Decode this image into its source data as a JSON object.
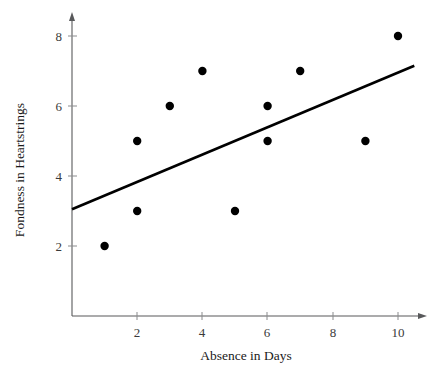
{
  "chart_data": {
    "type": "scatter",
    "title": "",
    "xlabel": "Absence in Days",
    "ylabel": "Fondness in Heartstrings",
    "xlim": [
      0,
      10.5
    ],
    "ylim": [
      0,
      8.6
    ],
    "grid": false,
    "legend": null,
    "x_ticks": [
      2,
      4,
      6,
      8,
      10
    ],
    "y_ticks": [
      2,
      4,
      6,
      8
    ],
    "x_tick_labels": [
      "2",
      "4",
      "6",
      "8",
      "10"
    ],
    "y_tick_labels": [
      "2",
      "4",
      "6",
      "8"
    ],
    "points": [
      {
        "x": 1,
        "y": 2
      },
      {
        "x": 2,
        "y": 5
      },
      {
        "x": 2,
        "y": 3
      },
      {
        "x": 3,
        "y": 6
      },
      {
        "x": 4,
        "y": 7
      },
      {
        "x": 5,
        "y": 3
      },
      {
        "x": 6,
        "y": 6
      },
      {
        "x": 6,
        "y": 5
      },
      {
        "x": 7,
        "y": 7
      },
      {
        "x": 9,
        "y": 5
      },
      {
        "x": 10,
        "y": 8
      }
    ],
    "trend_line": {
      "x_start": 0,
      "y_start": 3.05,
      "x_end": 10.5,
      "y_end": 7.15
    },
    "marker_color": "#000000",
    "line_color": "#000000",
    "axis_color": "#58595b",
    "background_color": "#ffffff",
    "marker_radius_px": 4.2
  }
}
